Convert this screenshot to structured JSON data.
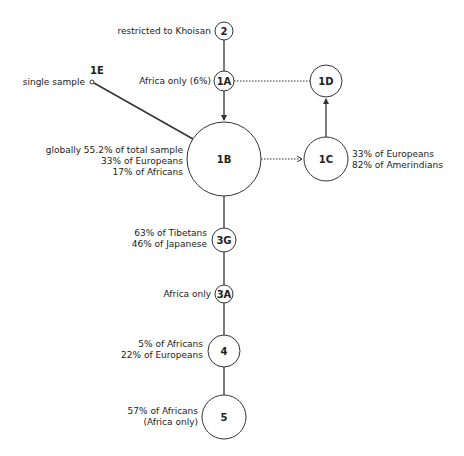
{
  "diagram": {
    "type": "haplogroup-network",
    "nodes": [
      {
        "id": "2",
        "label": "2",
        "cx": 224,
        "cy": 31,
        "r": 9,
        "annotation": [
          "restricted to Khoisan"
        ]
      },
      {
        "id": "1A",
        "label": "1A",
        "cx": 224,
        "cy": 81,
        "r": 10,
        "annotation": [
          "Africa only (6%)"
        ]
      },
      {
        "id": "1E",
        "label": "1E",
        "cx": 92,
        "cy": 82,
        "r": 2,
        "annotation": [
          "single sample"
        ]
      },
      {
        "id": "1D",
        "label": "1D",
        "cx": 326,
        "cy": 81,
        "r": 16,
        "annotation": []
      },
      {
        "id": "1B",
        "label": "1B",
        "cx": 224,
        "cy": 159,
        "r": 37,
        "annotation": [
          "globally 55.2% of total sample",
          "33% of Europeans",
          "17% of Africans"
        ]
      },
      {
        "id": "1C",
        "label": "1C",
        "cx": 326,
        "cy": 159,
        "r": 22,
        "annotation": [
          "33% of Europeans",
          "82% of Amerindians"
        ]
      },
      {
        "id": "3G",
        "label": "3G",
        "cx": 224,
        "cy": 240,
        "r": 12,
        "annotation": [
          "63% of Tibetans",
          "46% of Japanese"
        ]
      },
      {
        "id": "3A",
        "label": "3A",
        "cx": 224,
        "cy": 294,
        "r": 9,
        "annotation": [
          "Africa only"
        ]
      },
      {
        "id": "4",
        "label": "4",
        "cx": 224,
        "cy": 351,
        "r": 16,
        "annotation": [
          "5% of Africans",
          "22% of Europeans"
        ]
      },
      {
        "id": "5",
        "label": "5",
        "cx": 224,
        "cy": 417,
        "r": 22,
        "annotation": [
          "57% of Africans",
          "(Africa only)"
        ]
      }
    ],
    "edges": [
      {
        "from": "2",
        "to": "1A",
        "style": "solid",
        "arrow": false
      },
      {
        "from": "1A",
        "to": "1B",
        "style": "solid",
        "arrow": true
      },
      {
        "from": "1A",
        "to": "1D",
        "style": "dotted",
        "arrow": false
      },
      {
        "from": "1E",
        "to": "1B",
        "style": "solid",
        "arrow": false
      },
      {
        "from": "1B",
        "to": "1C",
        "style": "dotted",
        "arrow": true
      },
      {
        "from": "1C",
        "to": "1D",
        "style": "solid",
        "arrow": true
      },
      {
        "from": "1B",
        "to": "3G",
        "style": "solid",
        "arrow": false
      },
      {
        "from": "3G",
        "to": "3A",
        "style": "solid",
        "arrow": false
      },
      {
        "from": "3A",
        "to": "4",
        "style": "solid",
        "arrow": false
      },
      {
        "from": "4",
        "to": "5",
        "style": "solid",
        "arrow": false
      }
    ],
    "colors": {
      "stroke": "#333333",
      "text": "#222222",
      "fill": "#ffffff"
    }
  },
  "labels": {
    "n2": "2",
    "n1A": "1A",
    "n1E": "1E",
    "n1D": "1D",
    "n1B": "1B",
    "n1C": "1C",
    "n3G": "3G",
    "n3A": "3A",
    "n4": "4",
    "n5": "5",
    "ann2": "restricted to Khoisan",
    "ann1A": "Africa only (6%)",
    "ann1E": "single sample",
    "ann1B_1": "globally 55.2% of total sample",
    "ann1B_2": "33% of Europeans",
    "ann1B_3": "17% of Africans",
    "ann1C_1": "33% of Europeans",
    "ann1C_2": "82% of Amerindians",
    "ann3G_1": "63% of Tibetans",
    "ann3G_2": "46% of Japanese",
    "ann3A": "Africa only",
    "ann4_1": "5% of Africans",
    "ann4_2": "22% of Europeans",
    "ann5_1": "57% of Africans",
    "ann5_2": "(Africa only)"
  }
}
